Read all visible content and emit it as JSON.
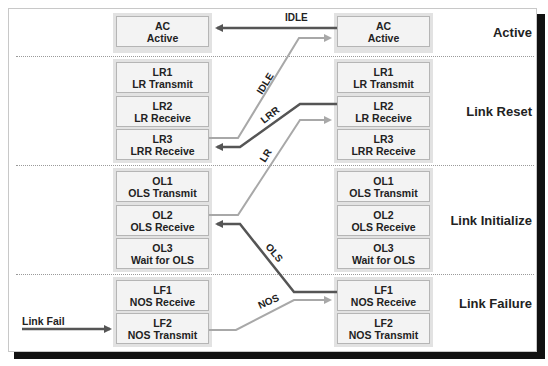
{
  "diagram": {
    "phases": [
      {
        "label": "Active"
      },
      {
        "label": "Link Reset"
      },
      {
        "label": "Link Initialize"
      },
      {
        "label": "Link Failure"
      }
    ],
    "left_states": [
      {
        "code": "AC",
        "name": "Active"
      },
      {
        "code": "LR1",
        "name": "LR Transmit"
      },
      {
        "code": "LR2",
        "name": "LR Receive"
      },
      {
        "code": "LR3",
        "name": "LRR Receive"
      },
      {
        "code": "OL1",
        "name": "OLS Transmit"
      },
      {
        "code": "OL2",
        "name": "OLS Receive"
      },
      {
        "code": "OL3",
        "name": "Wait for OLS"
      },
      {
        "code": "LF1",
        "name": "NOS Receive"
      },
      {
        "code": "LF2",
        "name": "NOS Transmit"
      }
    ],
    "right_states": [
      {
        "code": "AC",
        "name": "Active"
      },
      {
        "code": "LR1",
        "name": "LR Transmit"
      },
      {
        "code": "LR2",
        "name": "LR Receive"
      },
      {
        "code": "LR3",
        "name": "LRR Receive"
      },
      {
        "code": "OL1",
        "name": "OLS Transmit"
      },
      {
        "code": "OL2",
        "name": "OLS Receive"
      },
      {
        "code": "OL3",
        "name": "Wait for OLS"
      },
      {
        "code": "LF1",
        "name": "NOS Receive"
      },
      {
        "code": "LF2",
        "name": "NOS Transmit"
      }
    ],
    "transitions": [
      {
        "label": "IDLE",
        "from": "right AC",
        "to": "left AC",
        "color": "#555555"
      },
      {
        "label": "IDLE",
        "from": "left LR3",
        "to": "right AC",
        "color": "#a8a8a8"
      },
      {
        "label": "LRR",
        "from": "right LR2",
        "to": "left LR3",
        "color": "#555555"
      },
      {
        "label": "LR",
        "from": "left OL2",
        "to": "right LR2",
        "color": "#a8a8a8"
      },
      {
        "label": "OLS",
        "from": "right LF1",
        "to": "left OL2",
        "color": "#555555"
      },
      {
        "label": "NOS",
        "from": "left LF2",
        "to": "right LF1",
        "color": "#a8a8a8"
      }
    ],
    "external_input": {
      "label": "Link Fail",
      "to": "left LF2"
    },
    "colors": {
      "dark_arrow": "#555555",
      "light_arrow": "#a8a8a8",
      "box_fill": "#f3f3f3",
      "column_fill": "#e2e2e2"
    }
  }
}
